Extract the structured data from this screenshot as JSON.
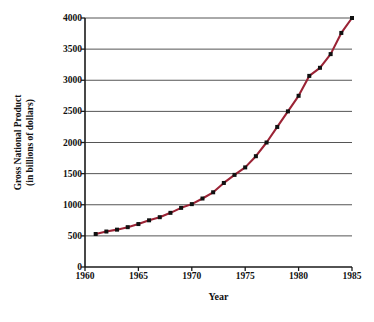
{
  "chart_data": {
    "type": "line",
    "title": "",
    "xlabel": "Year",
    "ylabel": "Gross National Product (in billions of dollars)",
    "ylabel_line1": "Gross National Product",
    "ylabel_line2": "(in billions of dollars)",
    "xlim": [
      1960,
      1985
    ],
    "ylim": [
      0,
      4000
    ],
    "xticks": [
      1960,
      1965,
      1970,
      1975,
      1980,
      1985
    ],
    "xtick_labels": [
      "1960",
      "1965",
      "1970",
      "1975",
      "1980",
      "1985"
    ],
    "yticks": [
      0,
      500,
      1000,
      1500,
      2000,
      2500,
      3000,
      3500,
      4000
    ],
    "ytick_labels": [
      "0",
      "500",
      "1000",
      "1500",
      "2000",
      "2500",
      "3000",
      "3500",
      "4000"
    ],
    "grid": "horizontal",
    "grid_color": "#555555",
    "legend": "none",
    "line_color": "#9B2335",
    "marker_color": "#111111",
    "marker_style": "square",
    "x": [
      1961,
      1962,
      1963,
      1964,
      1965,
      1966,
      1967,
      1968,
      1969,
      1970,
      1971,
      1972,
      1973,
      1974,
      1975,
      1976,
      1977,
      1978,
      1979,
      1980,
      1981,
      1982,
      1983,
      1984,
      1985
    ],
    "values": [
      530,
      570,
      600,
      640,
      690,
      750,
      800,
      870,
      950,
      1010,
      1100,
      1200,
      1350,
      1480,
      1600,
      1780,
      2000,
      2250,
      2500,
      2750,
      3070,
      3200,
      3420,
      3760,
      4000
    ],
    "series": [
      {
        "name": "Gross National Product",
        "values": [
          530,
          570,
          600,
          640,
          690,
          750,
          800,
          870,
          950,
          1010,
          1100,
          1200,
          1350,
          1480,
          1600,
          1780,
          2000,
          2250,
          2500,
          2750,
          3070,
          3200,
          3420,
          3760,
          4000
        ]
      }
    ]
  }
}
